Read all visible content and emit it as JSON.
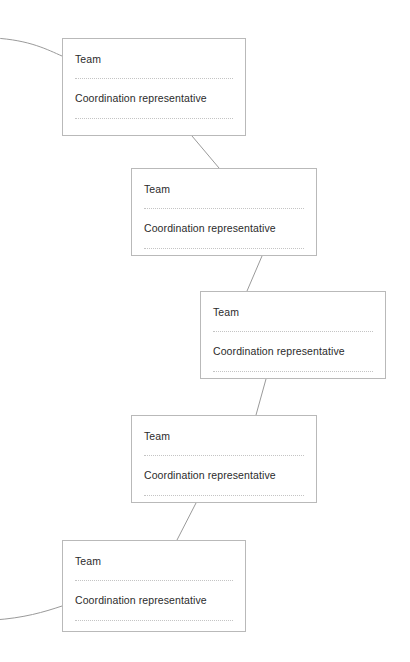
{
  "diagram": {
    "type": "org-chain-flow",
    "background_color": "#ffffff",
    "card_border_color": "#b9b9b9",
    "divider_color": "#c4c4c4",
    "connector_color": "#9a9a9a",
    "text_color": "#2b2b2b",
    "nodes": [
      {
        "id": "team-1",
        "title": "Team",
        "role": "Coordination representative",
        "x": 62,
        "y": 38,
        "width": 184,
        "height": 98
      },
      {
        "id": "team-2",
        "title": "Team",
        "role": "Coordination representative",
        "x": 131,
        "y": 168,
        "width": 186,
        "height": 88
      },
      {
        "id": "team-3",
        "title": "Team",
        "role": "Coordination representative",
        "x": 200,
        "y": 291,
        "width": 186,
        "height": 88
      },
      {
        "id": "team-4",
        "title": "Team",
        "role": "Coordination representative",
        "x": 131,
        "y": 415,
        "width": 186,
        "height": 88
      },
      {
        "id": "team-5",
        "title": "Team",
        "role": "Coordination representative",
        "x": 62,
        "y": 540,
        "width": 184,
        "height": 92
      }
    ],
    "connectors": [
      {
        "id": "inbound-top-left",
        "from": "off-canvas-left",
        "to": "team-1",
        "path": "M -6 38 C 30 40, 48 50, 62 56"
      },
      {
        "id": "team-1-to-team-2",
        "from": "team-1",
        "to": "team-2",
        "path": "M 192 136 L 219 168"
      },
      {
        "id": "team-2-to-team-3",
        "from": "team-2",
        "to": "team-3",
        "path": "M 262 256 L 247 291"
      },
      {
        "id": "team-3-to-team-4",
        "from": "team-3",
        "to": "team-4",
        "path": "M 266 379 L 256 415"
      },
      {
        "id": "team-4-to-team-5",
        "from": "team-4",
        "to": "team-5",
        "path": "M 196 503 L 177 540"
      },
      {
        "id": "outbound-bottom-left",
        "from": "team-5",
        "to": "off-canvas-left",
        "path": "M 62 606 C 44 612, 24 618, -6 620"
      }
    ]
  }
}
